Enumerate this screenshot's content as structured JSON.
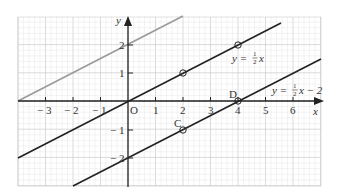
{
  "figure": {
    "axes": {
      "x_label": "x",
      "y_label": "y",
      "origin_label": "O",
      "x_ticks": [
        "− 3",
        "− 2",
        "− 1",
        "1",
        "2",
        "3",
        "4",
        "5",
        "6"
      ],
      "y_ticks": [
        "2",
        "1",
        "− 1",
        "− 2"
      ]
    },
    "lines": [
      {
        "name": "y = 1/2 x + 2",
        "color": "#999999"
      },
      {
        "name": "y = 1/2 x",
        "color": "#222222",
        "label_left": "y = ",
        "label_frac": "1/2",
        "label_right": "x"
      },
      {
        "name": "y = 1/2 x − 2",
        "color": "#222222",
        "label_left": "y = ",
        "label_frac": "1/2",
        "label_right": "x − 2"
      }
    ],
    "points": [
      {
        "label": "",
        "x": 2,
        "y": 1
      },
      {
        "label": "",
        "x": 4,
        "y": 2
      },
      {
        "label": "C",
        "x": 2,
        "y": -1
      },
      {
        "label": "D",
        "x": 4,
        "y": 0
      }
    ],
    "colors": {
      "grid_minor": "#e6e6e6",
      "grid_major": "#cccccc",
      "axis": "#222222"
    }
  },
  "chart_data": {
    "type": "line",
    "title": "",
    "xlabel": "x",
    "ylabel": "y",
    "xlim": [
      -4,
      7
    ],
    "ylim": [
      -3,
      3
    ],
    "grid": true,
    "series": [
      {
        "name": "y = 1/2 x + 2",
        "x": [
          -4,
          2
        ],
        "y": [
          0,
          3
        ]
      },
      {
        "name": "y = 1/2 x",
        "x": [
          -4,
          5.5
        ],
        "y": [
          -2,
          2.75
        ]
      },
      {
        "name": "y = 1/2 x − 2",
        "x": [
          -2,
          7
        ],
        "y": [
          -3,
          1.5
        ]
      }
    ],
    "annotations": [
      {
        "text": "C",
        "x": 2,
        "y": -1
      },
      {
        "text": "D",
        "x": 4,
        "y": 0
      },
      {
        "text": "y = ½x",
        "x": 4,
        "y": 1.5
      },
      {
        "text": "y = ½x − 2",
        "x": 5.5,
        "y": 0.5
      }
    ]
  }
}
